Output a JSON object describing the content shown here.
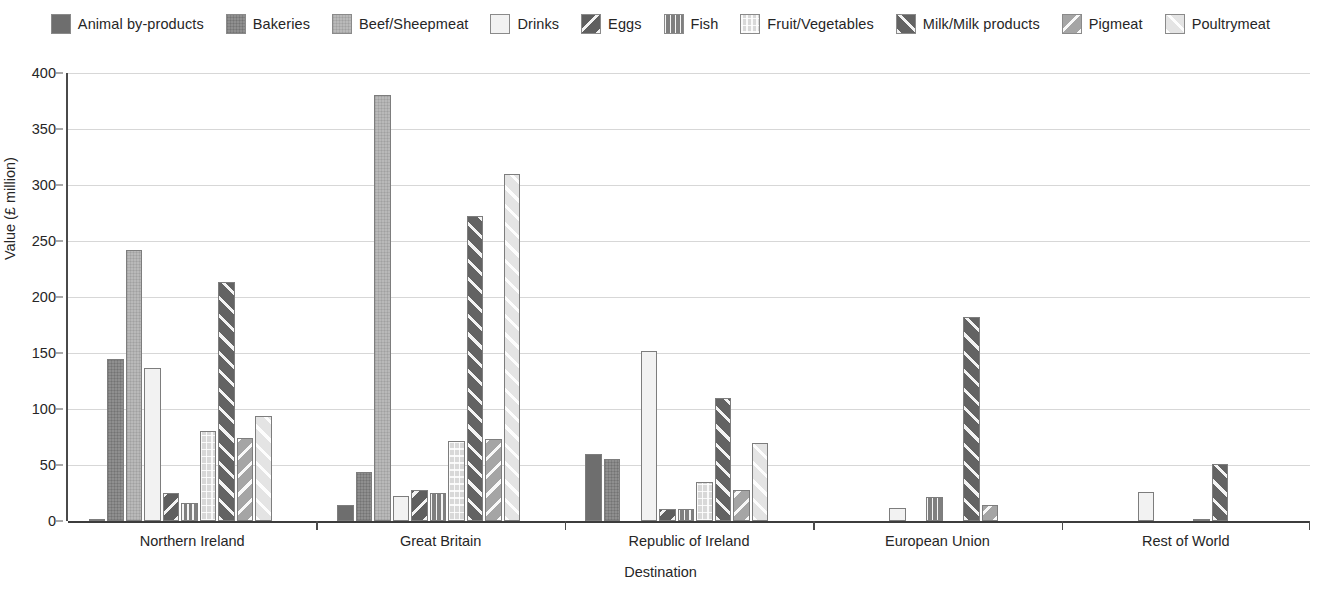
{
  "chart_data": {
    "type": "bar",
    "title": "",
    "xlabel": "Destination",
    "ylabel": "Value (£ million)",
    "ylim": [
      0,
      400
    ],
    "yticks": [
      0,
      50,
      100,
      150,
      200,
      250,
      300,
      350,
      400
    ],
    "grid": true,
    "legend_position": "top",
    "categories": [
      "Northern Ireland",
      "Great Britain",
      "Republic of Ireland",
      "European Union",
      "Rest of World"
    ],
    "series": [
      {
        "name": "Animal by-products",
        "color": "#6e6e6e",
        "pattern": "solid",
        "values": [
          1.5,
          14,
          60,
          0,
          0
        ]
      },
      {
        "name": "Bakeries",
        "color": "#8f8f8f",
        "pattern": "dots",
        "values": [
          145,
          44,
          55,
          0,
          0
        ]
      },
      {
        "name": "Beef/Sheepmeat",
        "color": "#b9b9b9",
        "pattern": "dots-light",
        "values": [
          242,
          380,
          0,
          0,
          0
        ]
      },
      {
        "name": "Drinks",
        "color": "#f2f2f2",
        "pattern": "plain",
        "values": [
          137,
          22,
          152,
          12,
          26
        ]
      },
      {
        "name": "Eggs",
        "color": "#5f5f5f",
        "pattern": "diag-down",
        "values": [
          25,
          28,
          11,
          0,
          0
        ]
      },
      {
        "name": "Fish",
        "color": "#7f7f7f",
        "pattern": "vertical",
        "values": [
          16,
          25,
          11,
          21,
          0
        ]
      },
      {
        "name": "Fruit/Vegetables",
        "color": "#d8d8d8",
        "pattern": "grid",
        "values": [
          80,
          71,
          35,
          0,
          2
        ]
      },
      {
        "name": "Milk/Milk products",
        "color": "#636363",
        "pattern": "diag-up",
        "values": [
          213,
          272,
          110,
          182,
          51
        ]
      },
      {
        "name": "Pigmeat",
        "color": "#a5a5a5",
        "pattern": "diag-down",
        "values": [
          74,
          73,
          28,
          14,
          0
        ]
      },
      {
        "name": "Poultrymeat",
        "color": "#e4e4e4",
        "pattern": "diag-up",
        "values": [
          94,
          310,
          70,
          0,
          0
        ]
      }
    ]
  },
  "axis": {
    "y_title": "Value (£ million)",
    "x_title": "Destination"
  }
}
